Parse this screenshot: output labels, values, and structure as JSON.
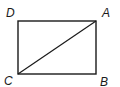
{
  "figure": {
    "shape": "rectangle",
    "stroke_color": "#1a1a1a",
    "vertices": [
      {
        "name": "A",
        "x": 96,
        "y": 21
      },
      {
        "name": "B",
        "x": 96,
        "y": 74
      },
      {
        "name": "C",
        "x": 18,
        "y": 74
      },
      {
        "name": "D",
        "x": 18,
        "y": 21
      }
    ],
    "diagonal": {
      "from": "C",
      "to": "A"
    },
    "labels": {
      "A": "A",
      "B": "B",
      "C": "C",
      "D": "D"
    }
  }
}
